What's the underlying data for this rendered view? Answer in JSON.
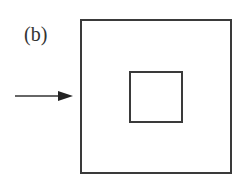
{
  "figure": {
    "label": "(b)",
    "elements": [
      {
        "type": "outer-square",
        "color": "#3a3a3a"
      },
      {
        "type": "inner-square",
        "color": "#3a3a3a"
      },
      {
        "type": "arrow",
        "direction": "right",
        "color": "#333333"
      }
    ]
  }
}
